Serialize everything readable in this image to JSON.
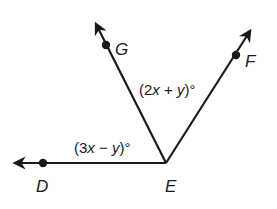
{
  "diagram": {
    "type": "angle-diagram",
    "vertex": {
      "label": "E"
    },
    "rays": [
      {
        "name": "ED",
        "point_label": "D",
        "direction": "left"
      },
      {
        "name": "EG",
        "point_label": "G",
        "direction": "upper-left"
      },
      {
        "name": "EF",
        "point_label": "F",
        "direction": "upper-right"
      }
    ],
    "angles": [
      {
        "between": "DEG",
        "expression": "(3x − y)°",
        "parts": {
          "open": "(3",
          "v1": "x",
          "op": " − ",
          "v2": "y",
          "close": ")°"
        }
      },
      {
        "between": "GEF",
        "expression": "(2x + y)°",
        "parts": {
          "open": "(2",
          "v1": "x",
          "op": " + ",
          "v2": "y",
          "close": ")°"
        }
      }
    ],
    "labels": {
      "D": "D",
      "E": "E",
      "G": "G",
      "F": "F"
    },
    "colors": {
      "stroke": "#1a1a1a",
      "background": "#ffffff"
    }
  }
}
